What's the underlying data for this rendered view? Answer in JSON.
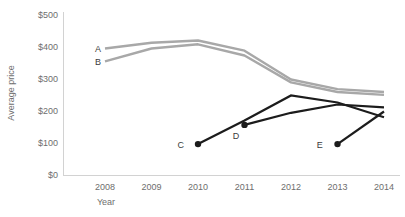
{
  "chart_data": {
    "type": "line",
    "title": "",
    "xlabel": "Year",
    "ylabel": "Average price",
    "x": [
      2008,
      2009,
      2010,
      2011,
      2012,
      2013,
      2014
    ],
    "xtick_labels": [
      "2008",
      "2009",
      "2010",
      "2011",
      "2012",
      "2013",
      "2014"
    ],
    "ytick_labels": [
      "$0",
      "$100",
      "$200",
      "$300",
      "$400",
      "$500"
    ],
    "ytick_values": [
      0,
      100,
      200,
      300,
      400,
      500
    ],
    "ylim": [
      0,
      500
    ],
    "xlim": [
      2007.6,
      2014.2
    ],
    "grid": false,
    "legend": "inline-labels",
    "series": [
      {
        "name": "A",
        "label": "A",
        "color": "#a8a8a8",
        "x": [
          2008,
          2009,
          2010,
          2011,
          2012,
          2013,
          2014
        ],
        "values": [
          397,
          415,
          422,
          390,
          300,
          270,
          261
        ],
        "label_x": 2007.85,
        "label_y": 397,
        "markers": false
      },
      {
        "name": "B",
        "label": "B",
        "color": "#a8a8a8",
        "x": [
          2008,
          2009,
          2010,
          2011,
          2012,
          2013,
          2014
        ],
        "values": [
          357,
          397,
          410,
          375,
          291,
          261,
          252
        ],
        "label_x": 2007.85,
        "label_y": 357,
        "markers": false
      },
      {
        "name": "C",
        "label": "C",
        "color": "#1c1c1c",
        "x": [
          2010,
          2011,
          2012,
          2013,
          2014
        ],
        "values": [
          98,
          172,
          250,
          228,
          182
        ],
        "label_x": 2009.63,
        "label_y": 98,
        "marker_points": [
          {
            "x": 2010,
            "y": 98
          }
        ]
      },
      {
        "name": "D",
        "label": "D",
        "color": "#1c1c1c",
        "x": [
          2011,
          2012,
          2013,
          2014
        ],
        "values": [
          158,
          196,
          222,
          213
        ],
        "label_x": 2010.82,
        "label_y": 126,
        "marker_points": [
          {
            "x": 2011,
            "y": 158
          }
        ]
      },
      {
        "name": "E",
        "label": "E",
        "color": "#1c1c1c",
        "x": [
          2013,
          2014
        ],
        "values": [
          98,
          200
        ],
        "label_x": 2012.62,
        "label_y": 98,
        "marker_points": [
          {
            "x": 2013,
            "y": 98
          }
        ]
      }
    ]
  },
  "axes": {
    "y_title": "Average price",
    "x_title": "Year"
  }
}
